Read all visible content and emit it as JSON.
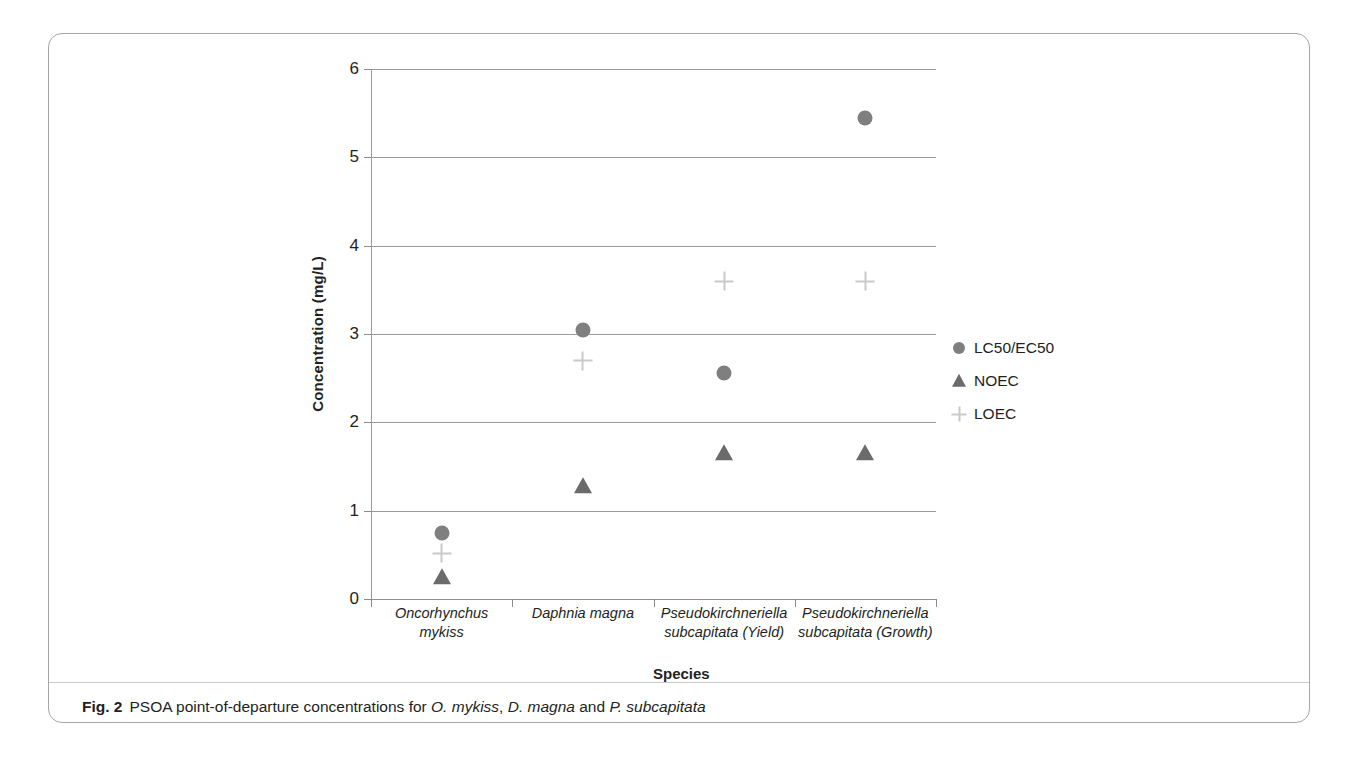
{
  "figure": {
    "caption_label": "Fig. 2",
    "caption_text_1": "PSOA point-of-departure concentrations for ",
    "caption_species_1": "O. mykiss",
    "caption_text_2": ", ",
    "caption_species_2": "D. magna",
    "caption_text_3": " and ",
    "caption_species_3": "P. subcapitata",
    "caption_full": "Fig. 2 PSOA point-of-departure concentrations for O. mykiss, D. magna and P. subcapitata"
  },
  "colors": {
    "circle": "#7f7f7f",
    "triangle": "#6b6b6b",
    "plus": "#c9c9c9",
    "gridline": "#9a9a9a",
    "text": "#231f20",
    "card_border": "#a6a6a6"
  },
  "chart_data": {
    "type": "scatter",
    "title": "",
    "xlabel": "Species",
    "ylabel": "Concentration (mg/L)",
    "ylim": [
      0,
      6
    ],
    "yticks": [
      0,
      1,
      2,
      3,
      4,
      5,
      6
    ],
    "ytick_labels": [
      "0",
      "1",
      "2",
      "3",
      "4",
      "5",
      "6"
    ],
    "grid": true,
    "legend_position": "right",
    "categories": [
      "Oncorhynchus mykiss",
      "Daphnia magna",
      "Pseudokirchneriella subcapitata (Yield)",
      "Pseudokirchneriella subcapitata (Growth)"
    ],
    "series": [
      {
        "name": "LC50/EC50",
        "marker": "circle",
        "color": "#7f7f7f",
        "values": [
          0.75,
          3.05,
          2.56,
          5.45
        ]
      },
      {
        "name": "NOEC",
        "marker": "triangle",
        "color": "#6b6b6b",
        "values": [
          0.25,
          1.28,
          1.65,
          1.65
        ]
      },
      {
        "name": "LOEC",
        "marker": "plus",
        "color": "#c9c9c9",
        "values": [
          0.52,
          2.7,
          3.6,
          3.6
        ]
      }
    ]
  }
}
